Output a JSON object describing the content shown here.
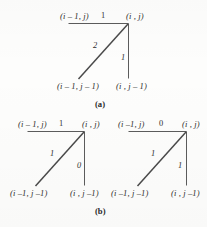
{
  "figure": {
    "background_color": "#fdfdfc",
    "line_color": "#4a4a4a",
    "text_color": "#2e2e2e"
  },
  "panels": [
    {
      "id": "a",
      "caption": "(a)",
      "diagrams": [
        {
          "id": "a1",
          "nodes": {
            "top_left": "(i – 1, j)",
            "top_right": "(i , j)",
            "bottom_left": "(i – 1, j – 1)",
            "bottom_right": "(i , j – 1)"
          },
          "edges": {
            "horizontal_weight": "1",
            "diagonal_weight": "2",
            "vertical_weight": "1"
          }
        }
      ]
    },
    {
      "id": "b",
      "caption": "(b)",
      "diagrams": [
        {
          "id": "b1",
          "nodes": {
            "top_left": "(i – 1, j)",
            "top_right": "(i , j)",
            "bottom_left": "(i –1, j –1)",
            "bottom_right": "(i , j –1)"
          },
          "edges": {
            "horizontal_weight": "1",
            "diagonal_weight": "1",
            "vertical_weight": "0"
          }
        },
        {
          "id": "b2",
          "nodes": {
            "top_left": "(i –1, j)",
            "top_right": "(i , j)",
            "bottom_left": "(i –1, j –1)",
            "bottom_right": "(i , j –1)"
          },
          "edges": {
            "horizontal_weight": "0",
            "diagonal_weight": "1",
            "vertical_weight": "1"
          }
        }
      ]
    }
  ]
}
